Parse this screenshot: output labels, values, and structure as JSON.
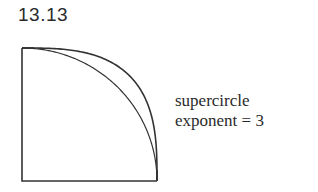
{
  "figure": {
    "label": "13.13",
    "caption": {
      "line1": "supercircle",
      "line2": "exponent = 3"
    }
  },
  "diagram": {
    "stroke_color": "#333333",
    "curves": [
      {
        "name": "circle",
        "exponent": 2
      },
      {
        "name": "supercircle",
        "exponent": 3
      }
    ]
  }
}
